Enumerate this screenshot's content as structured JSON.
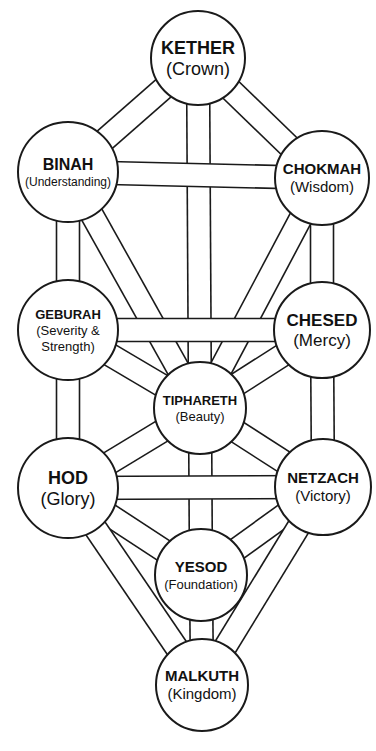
{
  "diagram": {
    "title": "Tree of Life",
    "colors": {
      "line": "#1a1a1a",
      "fill": "#ffffff",
      "text": "#111111"
    },
    "path_width": 23,
    "sephiroth": [
      {
        "id": "kether",
        "name": "KETHER",
        "meaning": [
          "(Crown)"
        ],
        "cx": 198,
        "cy": 58,
        "r": 47,
        "name_size": 18,
        "meaning_size": 18
      },
      {
        "id": "binah",
        "name": "BINAH",
        "meaning": [
          "(Understanding)"
        ],
        "cx": 68,
        "cy": 172,
        "r": 50,
        "name_size": 16,
        "meaning_size": 12
      },
      {
        "id": "chokmah",
        "name": "CHOKMAH",
        "meaning": [
          "(Wisdom)"
        ],
        "cx": 322,
        "cy": 178,
        "r": 47,
        "name_size": 15,
        "meaning_size": 15
      },
      {
        "id": "geburah",
        "name": "GEBURAH",
        "meaning": [
          "(Severity &",
          "Strength)"
        ],
        "cx": 68,
        "cy": 330,
        "r": 50,
        "name_size": 13,
        "meaning_size": 13
      },
      {
        "id": "chesed",
        "name": "CHESED",
        "meaning": [
          "(Mercy)"
        ],
        "cx": 322,
        "cy": 330,
        "r": 48,
        "name_size": 17,
        "meaning_size": 17
      },
      {
        "id": "tiphareth",
        "name": "TIPHARETH",
        "meaning": [
          "(Beauty)"
        ],
        "cx": 200,
        "cy": 408,
        "r": 46,
        "name_size": 13,
        "meaning_size": 13
      },
      {
        "id": "hod",
        "name": "HOD",
        "meaning": [
          "(Glory)"
        ],
        "cx": 68,
        "cy": 488,
        "r": 50,
        "name_size": 18,
        "meaning_size": 18
      },
      {
        "id": "netzach",
        "name": "NETZACH",
        "meaning": [
          "(Victory)"
        ],
        "cx": 323,
        "cy": 487,
        "r": 48,
        "name_size": 15,
        "meaning_size": 15
      },
      {
        "id": "yesod",
        "name": "YESOD",
        "meaning": [
          "(Foundation)"
        ],
        "cx": 201,
        "cy": 575,
        "r": 46,
        "name_size": 15,
        "meaning_size": 13
      },
      {
        "id": "malkuth",
        "name": "MALKUTH",
        "meaning": [
          "(Kingdom)"
        ],
        "cx": 202,
        "cy": 685,
        "r": 46,
        "name_size": 15,
        "meaning_size": 15
      }
    ],
    "paths": [
      [
        "kether",
        "binah"
      ],
      [
        "kether",
        "chokmah"
      ],
      [
        "kether",
        "tiphareth"
      ],
      [
        "binah",
        "chokmah"
      ],
      [
        "binah",
        "geburah"
      ],
      [
        "binah",
        "tiphareth"
      ],
      [
        "chokmah",
        "chesed"
      ],
      [
        "chokmah",
        "tiphareth"
      ],
      [
        "geburah",
        "chesed"
      ],
      [
        "geburah",
        "tiphareth"
      ],
      [
        "geburah",
        "hod"
      ],
      [
        "chesed",
        "tiphareth"
      ],
      [
        "chesed",
        "netzach"
      ],
      [
        "tiphareth",
        "hod"
      ],
      [
        "tiphareth",
        "netzach"
      ],
      [
        "tiphareth",
        "yesod"
      ],
      [
        "hod",
        "netzach"
      ],
      [
        "hod",
        "yesod"
      ],
      [
        "hod",
        "malkuth"
      ],
      [
        "netzach",
        "yesod"
      ],
      [
        "netzach",
        "malkuth"
      ],
      [
        "yesod",
        "malkuth"
      ]
    ]
  }
}
